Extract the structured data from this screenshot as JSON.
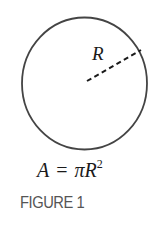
{
  "figure": {
    "radius_label": "R",
    "formula": {
      "lhs": "A",
      "equals": "=",
      "pi": "π",
      "var": "R",
      "exponent": "2"
    },
    "caption": "FIGURE 1"
  },
  "colors": {
    "stroke": "#444444",
    "text": "#1a1a1a",
    "caption": "#555555"
  }
}
